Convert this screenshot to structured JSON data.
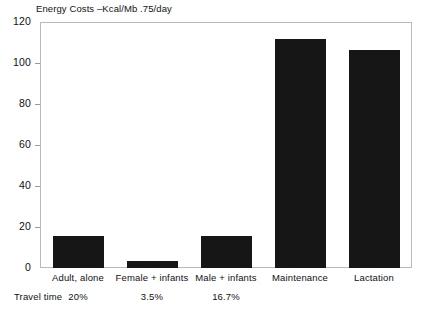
{
  "chart_data": {
    "type": "bar",
    "title": "Energy Costs –Kcal/Mb .75/day",
    "xlabel": "",
    "ylabel": "",
    "ylim": [
      0,
      120
    ],
    "yticks": [
      0,
      20,
      40,
      60,
      80,
      100,
      120
    ],
    "ytick_labels": [
      "0",
      "20",
      "40",
      "60",
      "80",
      "100",
      "120"
    ],
    "grid": false,
    "legend": "none",
    "bar_color": "#161616",
    "categories": [
      "Adult, alone",
      "Female + infants",
      "Male + infants",
      "Maintenance",
      "Lactation"
    ],
    "values": [
      15.5,
      3.5,
      15.5,
      112,
      107
    ],
    "annotations": {
      "row_label": "Travel time",
      "row_values": [
        "20%",
        "3.5%",
        "16.7%",
        "",
        ""
      ]
    }
  }
}
